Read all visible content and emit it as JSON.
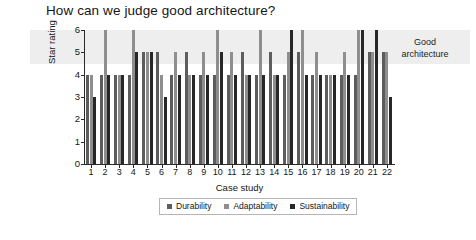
{
  "chart_data": {
    "type": "bar",
    "title": "How can we judge good architecture?",
    "xlabel": "Case study",
    "ylabel": "Star rating",
    "ylim": [
      0,
      6
    ],
    "yticks": [
      0,
      1,
      2,
      3,
      4,
      5,
      6
    ],
    "grid": false,
    "legend_position": "bottom-center",
    "categories": [
      "1",
      "2",
      "3",
      "4",
      "5",
      "6",
      "7",
      "8",
      "9",
      "10",
      "11",
      "12",
      "13",
      "14",
      "15",
      "16",
      "17",
      "18",
      "19",
      "20",
      "21",
      "22"
    ],
    "series": [
      {
        "name": "Durability",
        "color": "#5d5d5d",
        "values": [
          4,
          4,
          4,
          4,
          5,
          5,
          4,
          5,
          4,
          4,
          4,
          5,
          4,
          5,
          4,
          5,
          4,
          4,
          4,
          4,
          5,
          5
        ]
      },
      {
        "name": "Adaptability",
        "color": "#8e8e8e",
        "values": [
          4,
          6,
          4,
          6,
          5,
          4,
          5,
          4,
          5,
          6,
          5,
          4,
          6,
          4,
          5,
          6,
          5,
          4,
          5,
          6,
          5,
          5
        ]
      },
      {
        "name": "Sustainability",
        "color": "#272727",
        "values": [
          3,
          4,
          4,
          5,
          5,
          3,
          4,
          4,
          4,
          5,
          4,
          4,
          4,
          4,
          6,
          4,
          4,
          4,
          4,
          6,
          6,
          3
        ]
      }
    ],
    "annotations": [
      {
        "name": "good-architecture-band",
        "label": "Good architecture",
        "label_lines": [
          "Good",
          "architecture"
        ],
        "y_from": 4.5,
        "y_to": 6.0,
        "color": "#eeeeee"
      }
    ]
  },
  "legend": {
    "items": [
      {
        "label": "Durability"
      },
      {
        "label": "Adaptability"
      },
      {
        "label": "Sustainability"
      }
    ]
  }
}
